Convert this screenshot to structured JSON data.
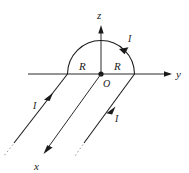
{
  "figure": {
    "background_color": "#ffffff",
    "ink_color": "#1a1a1a",
    "faint_color": "#8d8d8d",
    "axes": [
      {
        "name": "z",
        "label": "z",
        "direction": "up",
        "tip": [
          101,
          26
        ],
        "label_pos": [
          98,
          18
        ]
      },
      {
        "name": "y",
        "label": "y",
        "direction": "right",
        "tip": [
          172,
          74
        ],
        "label_pos": [
          176,
          78
        ]
      },
      {
        "name": "x",
        "label": "x",
        "direction": "down-left",
        "tip": [
          41,
          158
        ],
        "label_pos": [
          36,
          170
        ]
      }
    ],
    "origin": {
      "label": "O",
      "pos": [
        101,
        74
      ],
      "label_pos": [
        104,
        85
      ],
      "dot_radius": 2.4
    },
    "loop": {
      "shape": "semicircle",
      "radius_label": "R",
      "center": [
        101,
        74
      ],
      "radius_px": 33.5,
      "opens": "upper-half",
      "radius_markers": [
        {
          "label": "R",
          "pos": [
            82,
            69
          ]
        },
        {
          "label": "R",
          "pos": [
            117,
            69
          ]
        }
      ]
    },
    "current_labels": [
      {
        "label": "I",
        "pos": [
          129,
          40
        ],
        "on": "arc"
      },
      {
        "label": "I",
        "pos": [
          36,
          105
        ],
        "on": "left-wire"
      },
      {
        "label": "I",
        "pos": [
          117,
          119
        ],
        "on": "right-wire"
      }
    ],
    "wires": [
      {
        "name": "left-wire",
        "from": [
          67.5,
          74
        ],
        "to": [
          8,
          150
        ],
        "arrow_at": [
          50,
          97
        ],
        "dashed_tail": true
      },
      {
        "name": "center-wire",
        "from": [
          101,
          74
        ],
        "to": [
          44,
          152
        ],
        "arrow_at": [
          44,
          152
        ],
        "dashed_tail": false
      },
      {
        "name": "right-wire",
        "from": [
          134.5,
          74
        ],
        "to": [
          79,
          150
        ],
        "arrow_at": [
          112,
          112
        ],
        "dashed_tail": true
      }
    ]
  }
}
